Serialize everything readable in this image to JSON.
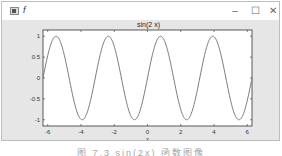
{
  "window": {
    "title": "f",
    "icon": "figure-icon",
    "controls": {
      "minimize": "–",
      "maximize": "☐",
      "close": "✕"
    }
  },
  "colors": {
    "figure_bg": "#e6e6e6",
    "axes_bg": "#ffffff",
    "line": "#7a7a7a",
    "axis": "#333333"
  },
  "chart_data": {
    "type": "line",
    "title": "sin(2 x)",
    "xlabel": "x",
    "ylabel": "",
    "function": "sin(2*x)",
    "xlim": [
      -6.2832,
      6.2832
    ],
    "ylim": [
      -1.15,
      1.15
    ],
    "xticks": [
      -6,
      -4,
      -2,
      0,
      2,
      4,
      6
    ],
    "xtick_labels": [
      "-6",
      "-4",
      "-2",
      "0",
      "2",
      "4",
      "6"
    ],
    "yticks": [
      1,
      0.5,
      0,
      -0.5,
      -1
    ],
    "ytick_labels": [
      "1",
      "0.5",
      "0",
      "-0.5",
      "-1"
    ],
    "grid": false,
    "legend": null,
    "series": [
      {
        "name": "sin(2 x)",
        "x": [
          -6.2832,
          -5.4978,
          -4.7124,
          -3.927,
          -3.1416,
          -2.3562,
          -1.5708,
          -0.7854,
          0,
          0.7854,
          1.5708,
          2.3562,
          3.1416,
          3.927,
          4.7124,
          5.4978,
          6.2832
        ],
        "values": [
          0,
          1,
          0,
          -1,
          0,
          1,
          0,
          -1,
          0,
          1,
          0,
          -1,
          0,
          1,
          0,
          -1,
          0
        ]
      }
    ]
  },
  "caption": "图 7.3  sin(2x) 函数图像"
}
